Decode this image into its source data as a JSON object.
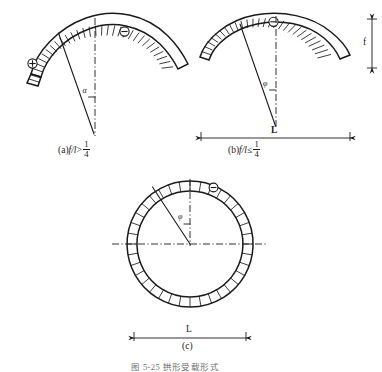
{
  "figure": {
    "bottom_caption": "图 5-25  拱形受载形式",
    "panels": [
      {
        "id": "a",
        "caption_prefix": "(a)",
        "ratio_symbol": "f/l",
        "relation": ">",
        "fraction_numerator": "1",
        "fraction_denominator": "4",
        "angle_label": "α",
        "sign_left": "⊕",
        "sign_right": "⊖",
        "type": "shallow-arch-steep"
      },
      {
        "id": "b",
        "caption_prefix": "(b)",
        "ratio_symbol": "f/l",
        "relation": "≤",
        "fraction_numerator": "1",
        "fraction_denominator": "4",
        "angle_label": "φ",
        "sign_crown": "⊖",
        "span_label": "L",
        "rise_label": "f",
        "type": "flat-arch"
      },
      {
        "id": "c",
        "caption_prefix": "(c)",
        "angle_label": "φ",
        "sign_crown": "⊖",
        "span_label": "L",
        "type": "full-ring"
      }
    ]
  },
  "colors": {
    "ink": "#1a1a1a",
    "paper": "#ffffff",
    "caption_gray": "#6e6e6e"
  }
}
